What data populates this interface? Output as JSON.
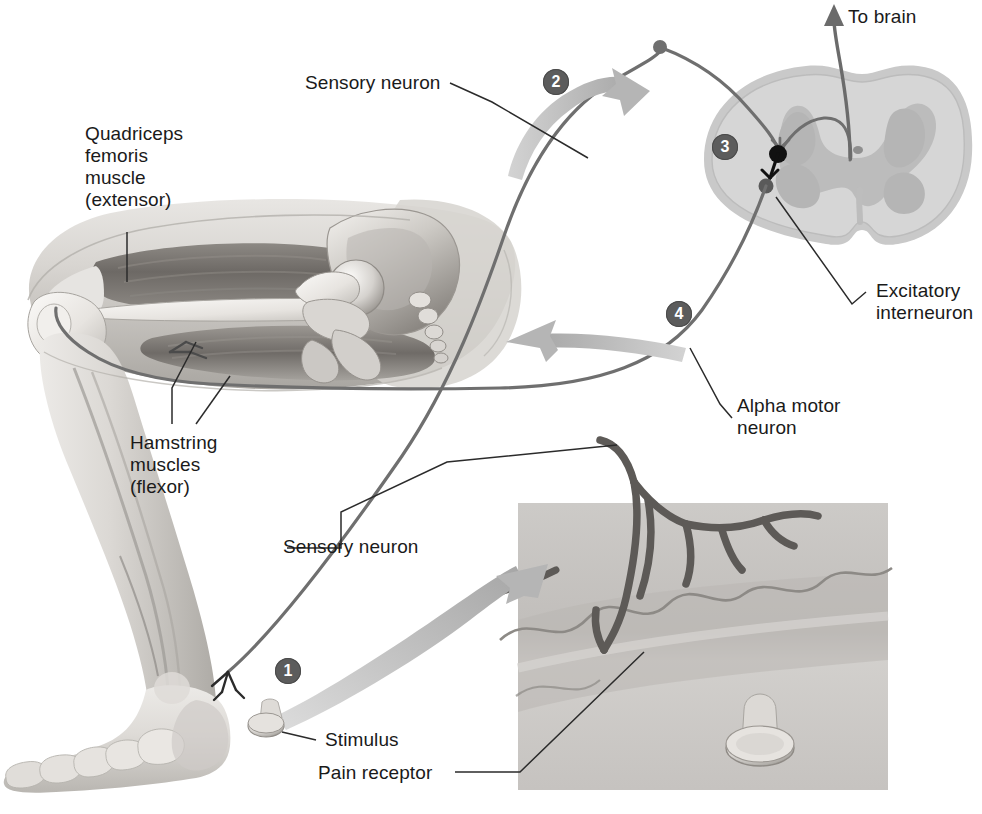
{
  "figure": {
    "type": "anatomical-diagram",
    "background_color": "#ffffff"
  },
  "labels": {
    "quadriceps": "Quadriceps\nfemoris\nmuscle\n(extensor)",
    "quadriceps_lines": [
      "Quadriceps",
      "femoris",
      "muscle",
      "(extensor)"
    ],
    "hamstring": "Hamstring\nmuscles\n(flexor)",
    "hamstring_lines": [
      "Hamstring",
      "muscles",
      "(flexor)"
    ],
    "sensory_neuron_top": "Sensory neuron",
    "sensory_neuron_bottom": "Sensory neuron",
    "to_brain": "To brain",
    "excitatory_interneuron": "Excitatory\ninterneuron",
    "excitatory_interneuron_lines": [
      "Excitatory",
      "interneuron"
    ],
    "alpha_motor_neuron": "Alpha motor\nneuron",
    "alpha_motor_neuron_lines": [
      "Alpha motor",
      "neuron"
    ],
    "stimulus": "Stimulus",
    "pain_receptor": "Pain receptor"
  },
  "steps": [
    {
      "id": 1,
      "label": "1",
      "meaning": "Stimulus activates pain receptor in skin"
    },
    {
      "id": 2,
      "label": "2",
      "meaning": "Sensory neuron carries impulse toward spinal cord"
    },
    {
      "id": 3,
      "label": "3",
      "meaning": "Excitatory interneuron relays signal in spinal cord gray matter"
    },
    {
      "id": 4,
      "label": "4",
      "meaning": "Alpha motor neuron conducts impulse back to flexor muscle"
    }
  ],
  "colors": {
    "ink": "#1a1a1a",
    "leader_line": "#2b2b2b",
    "step_badge_fill": "#5c5c5c",
    "step_badge_text": "#ffffff",
    "neuron_stroke": "#6f6f6f",
    "neuron_dark": "#111111",
    "flow_arrow_fill": "#bdbdbd",
    "to_brain_arrow": "#6b6b6b",
    "spinal_white_matter": "#d4d4d4",
    "spinal_gray_matter": "#c0c0c0",
    "spinal_outer_rim": "#c9c9c9",
    "inset_panel": "#c4c4c4",
    "inset_skin_band": "#d2d2d2",
    "limb_light": "#e3e1de",
    "limb_mid": "#c9c6c2",
    "limb_dark": "#8f8c88",
    "muscle_dark": "#6a6662",
    "bone_light": "#f2f0ed"
  },
  "parts": {
    "spinal_cord": "spinal cord cross-section",
    "leg": "flexed human leg with hip, femur, knee, tibia, fibula and foot",
    "inset": "magnified skin with free nerve endings and tack",
    "tack": "thumbtack stimulus"
  }
}
